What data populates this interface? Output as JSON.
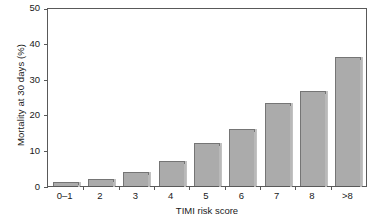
{
  "chart_data": {
    "type": "bar",
    "title": "",
    "xlabel": "TIMI risk score",
    "ylabel": "Mortality at 30 days (%)",
    "categories": [
      "0–1",
      "2",
      "3",
      "4",
      "5",
      "6",
      "7",
      "8",
      ">8"
    ],
    "values": [
      1.2,
      1.9,
      4.0,
      7.1,
      12.2,
      16.1,
      23.5,
      26.8,
      36.5
    ],
    "ylim": [
      0,
      50
    ],
    "yticks": [
      0,
      10,
      20,
      30,
      40,
      50
    ],
    "ytick_labels": [
      "0",
      "10",
      "20",
      "30",
      "40",
      "50"
    ],
    "grid": false,
    "legend": null,
    "legend_position": "none",
    "bar_color": "#ababab",
    "bar_edge_color": "#757575",
    "axis_color": "#595959",
    "background_color": "#ffffff",
    "text_color": "#1a1a1a"
  }
}
